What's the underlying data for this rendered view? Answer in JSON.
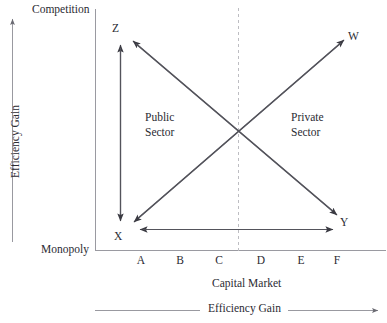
{
  "figure": {
    "type": "quadrant-diagram",
    "vertical_axis": {
      "title": "Efficiency Gain",
      "top_label": "Competition",
      "bottom_label": "Monopoly",
      "direction": "up"
    },
    "horizontal_axis": {
      "title": "Capital Market",
      "outer_title": "Efficiency Gain",
      "direction": "right",
      "ticks": [
        "A",
        "B",
        "C",
        "D",
        "E",
        "F"
      ]
    },
    "regions": [
      {
        "id": "public",
        "line1": "Public",
        "line2": "Sector"
      },
      {
        "id": "private",
        "line1": "Private",
        "line2": "Sector"
      }
    ],
    "nodes": [
      {
        "id": "z",
        "label": "Z"
      },
      {
        "id": "w",
        "label": "W"
      },
      {
        "id": "x",
        "label": "X"
      },
      {
        "id": "y",
        "label": "Y"
      }
    ],
    "arrows": [
      {
        "id": "z-x",
        "from": "X",
        "to": "Z",
        "style": "double-headed-vertical"
      },
      {
        "id": "x-y",
        "from": "X",
        "to": "Y",
        "style": "double-headed-horizontal"
      },
      {
        "id": "x-w",
        "from": "X",
        "to": "W",
        "style": "double-headed-diagonal-rising"
      },
      {
        "id": "z-y",
        "from": "Z",
        "to": "Y",
        "style": "double-headed-diagonal-falling"
      }
    ],
    "divider": {
      "id": "midline",
      "style": "dashed-vertical"
    },
    "colors": {
      "ink": "#2b2b33",
      "line": "#4a4a52",
      "frame": "#8d8d95",
      "dashed": "#b9b9be",
      "background": "#ffffff"
    }
  }
}
